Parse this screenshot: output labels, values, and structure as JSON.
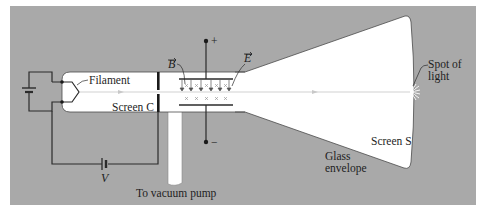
{
  "figure": {
    "colors": {
      "background": "#a9a9a9",
      "tube": "#ffffff",
      "beam": "#d0d0d0",
      "wire": "#2b2b2b"
    },
    "labels": {
      "filament": "Filament",
      "screen_c": "Screen C",
      "b_field": "B",
      "e_field": "E",
      "plus": "+",
      "minus": "−",
      "voltage": "V",
      "vacuum_pump": "To vacuum pump",
      "spot_line1": "Spot of",
      "spot_line2": "light",
      "screen_s": "Screen S",
      "glass_line1": "Glass",
      "glass_line2": "envelope"
    }
  }
}
